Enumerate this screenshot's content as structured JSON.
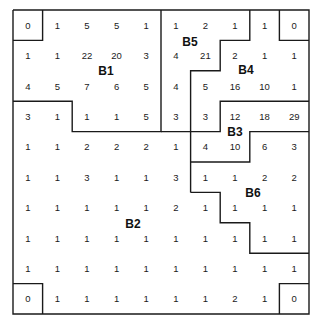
{
  "grid": {
    "rows": 10,
    "cols": 10,
    "origin": [
      13,
      10
    ],
    "cell_w": 29.6,
    "cell_h": 30.4,
    "values": [
      [
        "0",
        "1",
        "5",
        "5",
        "1",
        "1",
        "2",
        "1",
        "1",
        "0"
      ],
      [
        "1",
        "1",
        "22",
        "20",
        "3",
        "4",
        "21",
        "2",
        "1",
        "1"
      ],
      [
        "4",
        "5",
        "7",
        "6",
        "5",
        "4",
        "5",
        "16",
        "10",
        "1"
      ],
      [
        "3",
        "1",
        "1",
        "1",
        "5",
        "3",
        "3",
        "12",
        "18",
        "29"
      ],
      [
        "1",
        "1",
        "2",
        "2",
        "2",
        "1",
        "4",
        "10",
        "6",
        "3"
      ],
      [
        "1",
        "1",
        "3",
        "1",
        "1",
        "3",
        "1",
        "1",
        "2",
        "2"
      ],
      [
        "1",
        "1",
        "1",
        "1",
        "1",
        "2",
        "1",
        "1",
        "1",
        "1"
      ],
      [
        "1",
        "1",
        "1",
        "1",
        "1",
        "1",
        "1",
        "1",
        "1",
        "1"
      ],
      [
        "1",
        "1",
        "1",
        "1",
        "1",
        "1",
        "1",
        "1",
        "1",
        "1"
      ],
      [
        "0",
        "1",
        "1",
        "1",
        "1",
        "1",
        "1",
        "2",
        "1",
        "0"
      ]
    ]
  },
  "regions": [
    {
      "label": "B1",
      "x": 106,
      "y": 75
    },
    {
      "label": "B2",
      "x": 133,
      "y": 228
    },
    {
      "label": "B3",
      "x": 235,
      "y": 136
    },
    {
      "label": "B4",
      "x": 246,
      "y": 74
    },
    {
      "label": "B5",
      "x": 190,
      "y": 46
    },
    {
      "label": "B6",
      "x": 253,
      "y": 197
    }
  ],
  "colors": {
    "line": "#1a1a1a",
    "text": "#1a1a1a",
    "background": "#ffffff"
  }
}
